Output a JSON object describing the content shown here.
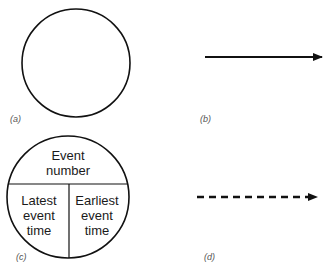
{
  "panels": {
    "a": {
      "caption": "(a)",
      "shape": "circle"
    },
    "b": {
      "caption": "(b)",
      "shape": "solid-arrow"
    },
    "c": {
      "caption": "(c)",
      "shape": "divided-circle",
      "top": {
        "line1": "Event",
        "line2": "number"
      },
      "left": {
        "line1": "Latest",
        "line2": "event",
        "line3": "time"
      },
      "right": {
        "line1": "Earliest",
        "line2": "event",
        "line3": "time"
      }
    },
    "d": {
      "caption": "(d)",
      "shape": "dashed-arrow"
    }
  },
  "colors": {
    "stroke": "#111111",
    "background": "#ffffff"
  }
}
